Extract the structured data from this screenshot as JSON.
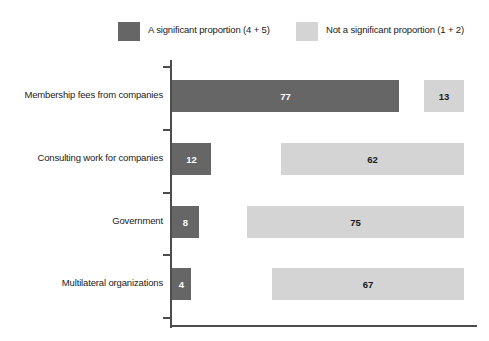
{
  "chart_data": {
    "type": "bar",
    "orientation": "horizontal",
    "title": "",
    "xlabel": "",
    "ylabel": "",
    "grid": false,
    "legend_position": "top",
    "categories": [
      "Membership fees from companies",
      "Consulting work for companies",
      "Government",
      "Multilateral organizations"
    ],
    "series": [
      {
        "name": "A significant proportion (4 + 5)",
        "color": "#666666",
        "values": [
          77,
          12,
          8,
          4
        ]
      },
      {
        "name": "Not a significant proportion (1 + 2)",
        "color": "#d4d4d4",
        "values": [
          13,
          62,
          75,
          67
        ]
      }
    ]
  },
  "legend": {
    "entries": [
      {
        "label": "A significant proportion (4 + 5)"
      },
      {
        "label": "Not a significant proportion (1 + 2)"
      }
    ]
  },
  "rows": [
    {
      "label": "Membership fees from companies",
      "significant": {
        "value": "77",
        "left": 172,
        "width": 227
      },
      "not_significant": {
        "value": "13",
        "left": 424,
        "width": 40
      }
    },
    {
      "label": "Consulting work for companies",
      "significant": {
        "value": "12",
        "left": 172,
        "width": 39
      },
      "not_significant": {
        "value": "62",
        "left": 281,
        "width": 183
      }
    },
    {
      "label": "Government",
      "significant": {
        "value": "8",
        "left": 172,
        "width": 27
      },
      "not_significant": {
        "value": "75",
        "left": 247,
        "width": 217
      }
    },
    {
      "label": "Multilateral organizations",
      "significant": {
        "value": "4",
        "left": 172,
        "width": 19
      },
      "not_significant": {
        "value": "67",
        "left": 272,
        "width": 192
      }
    }
  ],
  "axis": {
    "row_tops": [
      22,
      85,
      148,
      210
    ],
    "tick_tops": [
      8,
      71,
      134,
      196,
      259
    ]
  }
}
